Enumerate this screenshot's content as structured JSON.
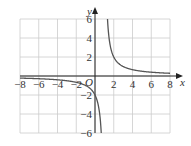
{
  "chart_data": {
    "type": "line",
    "title": "",
    "function": "y = 2/(x - 1)",
    "xlabel": "x",
    "ylabel": "y",
    "origin_label": "O",
    "xlim": [
      -8,
      8
    ],
    "ylim": [
      -6,
      6
    ],
    "grid": true,
    "x_ticks": [
      "-8",
      "-6",
      "-4",
      "-2",
      "2",
      "4",
      "6",
      "8"
    ],
    "y_ticks": [
      "6",
      "4",
      "2",
      "-2",
      "-4",
      "-6"
    ],
    "asymptotes": {
      "vertical": 1,
      "horizontal": 0
    },
    "series": [
      {
        "name": "left branch",
        "x": [
          -8,
          -6,
          -4,
          -2,
          -1,
          0,
          0.5,
          0.67
        ],
        "y": [
          -0.22,
          -0.29,
          -0.4,
          -0.67,
          -1,
          -2,
          -4,
          -6
        ]
      },
      {
        "name": "right branch",
        "x": [
          1.33,
          1.5,
          2,
          3,
          4,
          6,
          8
        ],
        "y": [
          6,
          4,
          2,
          1,
          0.67,
          0.4,
          0.29
        ]
      }
    ],
    "colors": {
      "curve": "#555555",
      "grid": "#cccccc",
      "axis": "#222222"
    }
  }
}
